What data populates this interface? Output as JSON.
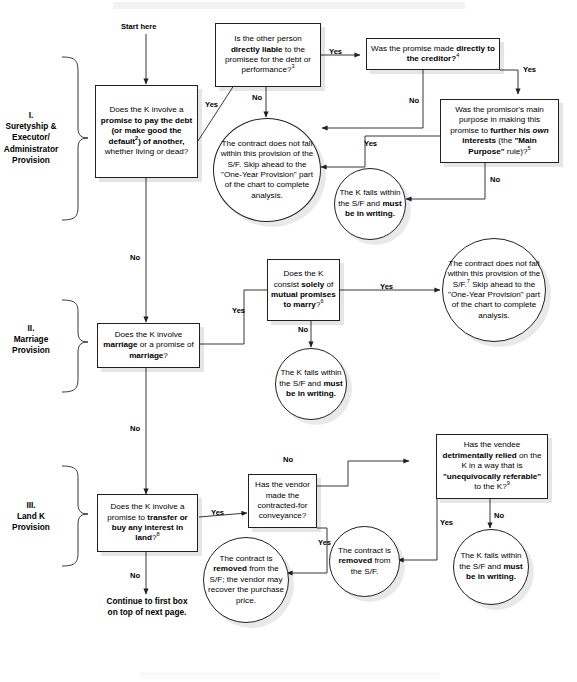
{
  "page": {
    "header_band": "",
    "footer_band": ""
  },
  "labels": {
    "start": "Start here",
    "yes": "Yes",
    "no": "No",
    "continue_note_line1": "Continue to first box",
    "continue_note_line2": "on top of next page."
  },
  "sections": [
    {
      "id": "I",
      "label": "I.\nSuretyship &\nExecutor/\nAdministrator\nProvision"
    },
    {
      "id": "II",
      "label": "II.\nMarriage\nProvision"
    },
    {
      "id": "III",
      "label": "III.\nLand K\nProvision"
    }
  ],
  "nodes": {
    "q1": {
      "shape": "box",
      "text_html": "Does the K involve a <b>promise to pay the debt (or make good the default<sup>2</sup>)</b> <b>of another,</b> whether living or dead?",
      "plain": "Does the K involve a promise to pay the debt (or make good the default2) of another, whether living or dead?"
    },
    "q2": {
      "shape": "box",
      "text_html": "Is the other person <b>directly liable</b> to the promisee for the debt or performance?<sup>3</sup>",
      "plain": "Is the other person directly liable to the promisee for the debt or performance? 3"
    },
    "q3": {
      "shape": "box",
      "text_html": "Was the promise made <b>directly to the creditor?</b><sup>4</sup>",
      "plain": "Was the promise made directly to the creditor? 4"
    },
    "q4": {
      "shape": "box",
      "text_html": "Was the promisor's main purpose in making this promise to <b>further his</b> <i>own</i> <b>interests</b> (the <b>\"Main Purpose\"</b> rule)?<sup>5</sup>",
      "plain": "Was the promisor's main purpose in making this promise to further his own interests (the \"Main Purpose\" rule)? 5"
    },
    "c1": {
      "shape": "circle",
      "text_html": "The contract does not fall within this provision of the S/F. Skip ahead to the \"One-Year Provision\" part of the chart to complete analysis.",
      "plain": "The contract does not fall within this provision of the S/F. Skip ahead to the \"One-Year Provision\" part of the chart to complete analysis."
    },
    "c2": {
      "shape": "circle",
      "text_html": "The K falls within the S/F and <b>must be in writing.</b>",
      "plain": "The K falls within the S/F and must be in writing."
    },
    "q5": {
      "shape": "box",
      "text_html": "Does the K involve <b>marriage</b> or a promise of <b>marriage</b>?",
      "plain": "Does the K involve marriage or a promise of marriage?"
    },
    "q6": {
      "shape": "box",
      "text_html": "Does the K consist <b>solely</b> of <b>mutual promises to marry</b>?<sup>6</sup>",
      "plain": "Does the K consist solely of mutual promises to marry? 6"
    },
    "c3": {
      "shape": "circle",
      "text_html": "The contract does not fall within this provision of the S/F.<sup>7</sup> Skip ahead to the \"One-Year Provision\" part of the chart to complete analysis.",
      "plain": "The contract does not fall within this provision of the S/F.7 Skip ahead to the \"One-Year Provision\" part of the chart to complete analysis."
    },
    "c4": {
      "shape": "circle",
      "text_html": "The K falls within the S/F and <b>must be in writing.</b>",
      "plain": "The K falls within the S/F and must be in writing."
    },
    "q7": {
      "shape": "box",
      "text_html": "Does the K involve a promise to <b>transfer or buy any interest in land</b>?<sup>8</sup>",
      "plain": "Does the K involve a promise to transfer or buy any interest in land? 8"
    },
    "q8": {
      "shape": "box",
      "text_html": "Has the vendor made the contracted-for conveyance?",
      "plain": "Has the vendor made the contracted-for conveyance?"
    },
    "q9": {
      "shape": "box",
      "text_html": "Has the vendee <b>detrimentally relied</b> on the K in a way that is <b>\"unequivocally referable\"</b> to the K?<sup>9</sup>",
      "plain": "Has the vendee detrimentally relied on the K in a way that is \"unequivocally referable\" to the K? 9"
    },
    "c5": {
      "shape": "circle",
      "text_html": "The contract is <b>removed</b> from the S/F; the vendor may recover the purchase price.",
      "plain": "The contract is removed from the S/F; the vendor may recover the purchase price."
    },
    "c6": {
      "shape": "circle",
      "text_html": "The contract is <b>removed</b> from the S/F.",
      "plain": "The contract is removed from the S/F."
    },
    "c7": {
      "shape": "circle",
      "text_html": "The K falls within the S/F and <b>must be in writing.</b>",
      "plain": "The K falls within the S/F and must be in writing."
    }
  },
  "edge_labels": [
    {
      "id": "e-q1-yes",
      "text": "Yes"
    },
    {
      "id": "e-q1-no",
      "text": "No"
    },
    {
      "id": "e-q2-yes",
      "text": "Yes"
    },
    {
      "id": "e-q2-no",
      "text": "No"
    },
    {
      "id": "e-q3-yes",
      "text": "Yes"
    },
    {
      "id": "e-q3-no",
      "text": "No"
    },
    {
      "id": "e-q4-yes",
      "text": "Yes"
    },
    {
      "id": "e-q4-no",
      "text": "No"
    },
    {
      "id": "e-q5-yes",
      "text": "Yes"
    },
    {
      "id": "e-q5-no",
      "text": "No"
    },
    {
      "id": "e-q6-yes",
      "text": "Yes"
    },
    {
      "id": "e-q6-no",
      "text": "No"
    },
    {
      "id": "e-q7-yes",
      "text": "Yes"
    },
    {
      "id": "e-q7-no",
      "text": "No"
    },
    {
      "id": "e-q8-yes",
      "text": "Yes"
    },
    {
      "id": "e-q8-no",
      "text": "No"
    },
    {
      "id": "e-q9-yes",
      "text": "Yes"
    },
    {
      "id": "e-q9-no",
      "text": "No"
    }
  ],
  "colors": {
    "stroke": "#231f20",
    "text": "#000000",
    "shadow": "rgba(0,0,0,0.10)",
    "background": "#ffffff",
    "band": "#f3f3f3"
  }
}
